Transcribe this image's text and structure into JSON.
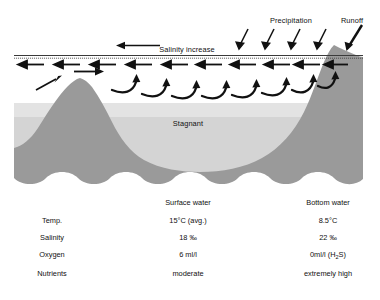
{
  "diagram": {
    "title_labels": {
      "precipitation": "Precipitation",
      "runoff": "Runoff",
      "salinity_increase": "Salinity increase",
      "stagnant": "Stagnant"
    },
    "colors": {
      "land": "#9a9a9a",
      "stagnant_upper": "#e2e2e2",
      "stagnant_lower": "#d2d2d2",
      "water": "#ffffff",
      "ink": "#111111",
      "surface_line": "#333333"
    },
    "counts": {
      "precipitation_arrows": 4,
      "surface_outflow_arrows": 10,
      "subsurface_hook_arrows": 8
    }
  },
  "table": {
    "columns": [
      "",
      "Surface water",
      "Bottom water"
    ],
    "rows": [
      {
        "label": "Temp.",
        "surface": "15°C (avg.)",
        "bottom_pre": "8.5°C",
        "bottom_sub": "",
        "bottom_post": ""
      },
      {
        "label": "Salinity",
        "surface": "18 ‰",
        "bottom_pre": "22 ‰",
        "bottom_sub": "",
        "bottom_post": ""
      },
      {
        "label": "Oxygen",
        "surface": "6 ml/l",
        "bottom_pre": "0ml/l (H",
        "bottom_sub": "2",
        "bottom_post": "S)"
      },
      {
        "label": "Nutrients",
        "surface": "moderate",
        "bottom_pre": "extremely high",
        "bottom_sub": "",
        "bottom_post": ""
      }
    ]
  }
}
